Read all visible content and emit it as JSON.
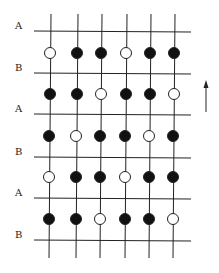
{
  "diagram": {
    "row_labels": [
      "A",
      "B",
      "A",
      "B",
      "A",
      "B"
    ],
    "rows": [
      [
        0,
        1,
        1,
        0,
        1,
        1
      ],
      [
        1,
        1,
        0,
        1,
        1,
        0
      ],
      [
        1,
        0,
        1,
        1,
        0,
        1
      ],
      [
        0,
        1,
        1,
        0,
        1,
        1
      ],
      [
        1,
        1,
        0,
        1,
        1,
        0
      ]
    ],
    "legend": {
      "filled": "filled circle",
      "open": "open circle"
    },
    "arrow": "up-arrow",
    "colors": {
      "line": "#222222",
      "fill": "#111111",
      "background": "#ffffff"
    }
  }
}
